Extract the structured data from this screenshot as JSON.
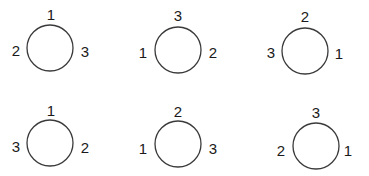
{
  "diagram": {
    "stroke_color": "#3a3a3a",
    "label_color": "#1a1a1a",
    "circles": [
      {
        "cx": 50,
        "cy": 48,
        "r": 23,
        "labels": {
          "top": "1",
          "left": "2",
          "right": "3"
        }
      },
      {
        "cx": 178,
        "cy": 50,
        "r": 23,
        "labels": {
          "top": "3",
          "left": "1",
          "right": "2"
        }
      },
      {
        "cx": 305,
        "cy": 51,
        "r": 23,
        "labels": {
          "top": "2",
          "left": "3",
          "right": "1"
        }
      },
      {
        "cx": 50,
        "cy": 143,
        "r": 23,
        "labels": {
          "top": "1",
          "left": "3",
          "right": "2"
        }
      },
      {
        "cx": 178,
        "cy": 144,
        "r": 23,
        "labels": {
          "top": "2",
          "left": "1",
          "right": "3"
        }
      },
      {
        "cx": 316,
        "cy": 146,
        "r": 23,
        "labels": {
          "top": "3",
          "left": "2",
          "right": "1"
        }
      }
    ]
  }
}
